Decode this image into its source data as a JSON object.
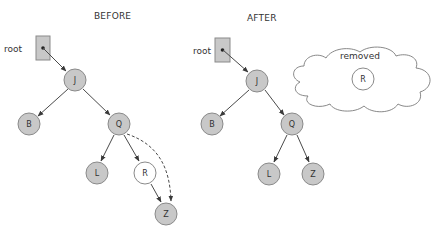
{
  "diagram": {
    "type": "binary-search-tree-deletion",
    "colors": {
      "node_fill": "#c8c8c8",
      "node_stroke": "#8a8a8a",
      "removed_fill": "#ffffff",
      "root_box_fill": "#c8c8c8",
      "edge": "#4a4a4a"
    },
    "before": {
      "title": "BEFORE",
      "root_label": "root",
      "nodes": [
        {
          "id": "J",
          "label": "J",
          "state": "normal"
        },
        {
          "id": "B",
          "label": "B",
          "state": "normal"
        },
        {
          "id": "Q",
          "label": "Q",
          "state": "normal"
        },
        {
          "id": "L",
          "label": "L",
          "state": "normal"
        },
        {
          "id": "R",
          "label": "R",
          "state": "removing"
        },
        {
          "id": "Z",
          "label": "Z",
          "state": "normal"
        }
      ],
      "edges": [
        {
          "from": "root",
          "to": "J",
          "style": "solid"
        },
        {
          "from": "J",
          "to": "B",
          "style": "solid"
        },
        {
          "from": "J",
          "to": "Q",
          "style": "solid"
        },
        {
          "from": "Q",
          "to": "L",
          "style": "solid"
        },
        {
          "from": "Q",
          "to": "R",
          "style": "solid"
        },
        {
          "from": "R",
          "to": "Z",
          "style": "solid"
        },
        {
          "from": "Q",
          "to": "Z",
          "style": "dashed"
        }
      ]
    },
    "after": {
      "title": "AFTER",
      "root_label": "root",
      "nodes": [
        {
          "id": "J",
          "label": "J",
          "state": "normal"
        },
        {
          "id": "B",
          "label": "B",
          "state": "normal"
        },
        {
          "id": "Q",
          "label": "Q",
          "state": "normal"
        },
        {
          "id": "L",
          "label": "L",
          "state": "normal"
        },
        {
          "id": "Z",
          "label": "Z",
          "state": "normal"
        }
      ],
      "edges": [
        {
          "from": "root",
          "to": "J",
          "style": "solid"
        },
        {
          "from": "J",
          "to": "B",
          "style": "solid"
        },
        {
          "from": "J",
          "to": "Q",
          "style": "solid"
        },
        {
          "from": "Q",
          "to": "L",
          "style": "solid"
        },
        {
          "from": "Q",
          "to": "Z",
          "style": "solid"
        }
      ],
      "removed_cloud": {
        "label": "removed",
        "node": {
          "id": "R",
          "label": "R"
        }
      }
    }
  }
}
